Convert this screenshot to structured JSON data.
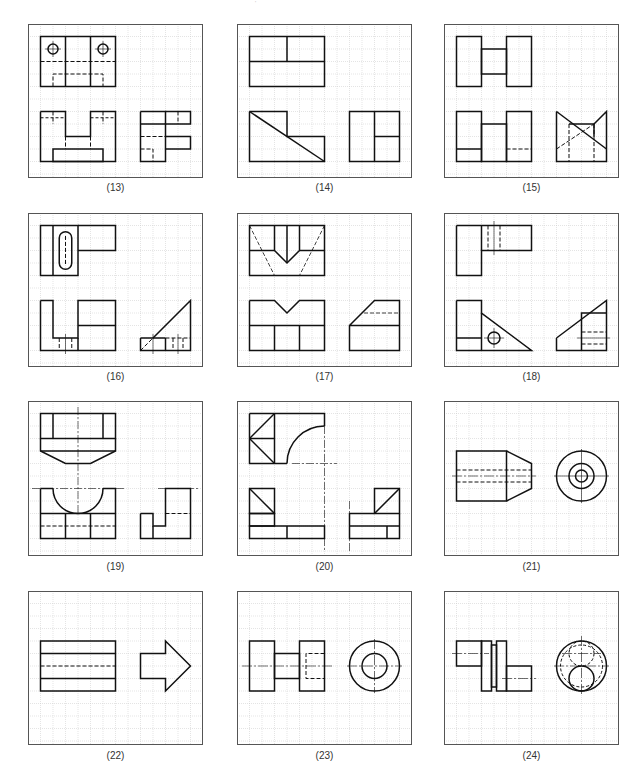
{
  "header": {
    "fragment": "' "
  },
  "grid": {
    "cell": 12.5,
    "line_color": "#c8c8c8",
    "border_color": "#555555",
    "stroke_color": "#111111"
  },
  "panels": [
    {
      "id": 13,
      "label": "(13)",
      "col": 0,
      "row": 0
    },
    {
      "id": 14,
      "label": "(14)",
      "col": 1,
      "row": 0
    },
    {
      "id": 15,
      "label": "(15)",
      "col": 2,
      "row": 0
    },
    {
      "id": 16,
      "label": "(16)",
      "col": 0,
      "row": 1
    },
    {
      "id": 17,
      "label": "(17)",
      "col": 1,
      "row": 1
    },
    {
      "id": 18,
      "label": "(18)",
      "col": 2,
      "row": 1
    },
    {
      "id": 19,
      "label": "(19)",
      "col": 0,
      "row": 2
    },
    {
      "id": 20,
      "label": "(20)",
      "col": 1,
      "row": 2
    },
    {
      "id": 21,
      "label": "(21)",
      "col": 2,
      "row": 2
    },
    {
      "id": 22,
      "label": "(22)",
      "col": 0,
      "row": 3
    },
    {
      "id": 23,
      "label": "(23)",
      "col": 1,
      "row": 3
    },
    {
      "id": 24,
      "label": "(24)",
      "col": 2,
      "row": 3
    }
  ]
}
